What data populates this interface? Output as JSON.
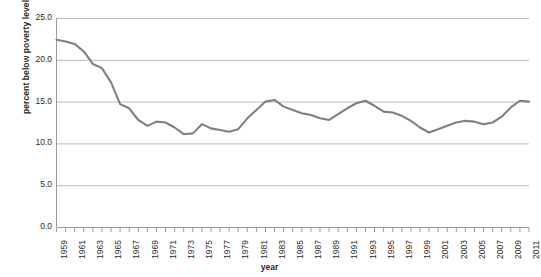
{
  "chart_data": {
    "type": "line",
    "title": "",
    "xlabel": "year",
    "ylabel": "percent below poverty level",
    "ylim": [
      0.0,
      25.0
    ],
    "ytick_labels": [
      "25.0",
      "20.0",
      "15.0",
      "10.0",
      "5.0",
      "0.0"
    ],
    "ytick_values": [
      25.0,
      20.0,
      15.0,
      10.0,
      5.0,
      0.0
    ],
    "xlim": [
      1959,
      2011
    ],
    "grid": "horizontal",
    "legend": "none",
    "line_color": "#808080",
    "series_name": "percent below poverty level",
    "xtick_labels": [
      "1959",
      "1961",
      "1963",
      "1965",
      "1967",
      "1969",
      "1971",
      "1973",
      "1975",
      "1977",
      "1979",
      "1981",
      "1983",
      "1985",
      "1987",
      "1989",
      "1991",
      "1993",
      "1995",
      "1997",
      "1999",
      "2001",
      "2003",
      "2005",
      "2007",
      "2009",
      "2011"
    ],
    "x": [
      1959,
      1960,
      1961,
      1962,
      1963,
      1964,
      1965,
      1966,
      1967,
      1968,
      1969,
      1970,
      1971,
      1972,
      1973,
      1974,
      1975,
      1976,
      1977,
      1978,
      1979,
      1980,
      1981,
      1982,
      1983,
      1984,
      1985,
      1986,
      1987,
      1988,
      1989,
      1990,
      1991,
      1992,
      1993,
      1994,
      1995,
      1996,
      1997,
      1998,
      1999,
      2000,
      2001,
      2002,
      2003,
      2004,
      2005,
      2006,
      2007,
      2008,
      2009,
      2010,
      2011
    ],
    "values": [
      22.4,
      22.2,
      21.9,
      21.0,
      19.5,
      19.0,
      17.3,
      14.7,
      14.2,
      12.8,
      12.1,
      12.6,
      12.5,
      11.9,
      11.1,
      11.2,
      12.3,
      11.8,
      11.6,
      11.4,
      11.7,
      13.0,
      14.0,
      15.0,
      15.2,
      14.4,
      14.0,
      13.6,
      13.4,
      13.0,
      12.8,
      13.5,
      14.2,
      14.8,
      15.1,
      14.5,
      13.8,
      13.7,
      13.3,
      12.7,
      11.9,
      11.3,
      11.7,
      12.1,
      12.5,
      12.7,
      12.6,
      12.3,
      12.5,
      13.2,
      14.3,
      15.1,
      15.0
    ]
  }
}
